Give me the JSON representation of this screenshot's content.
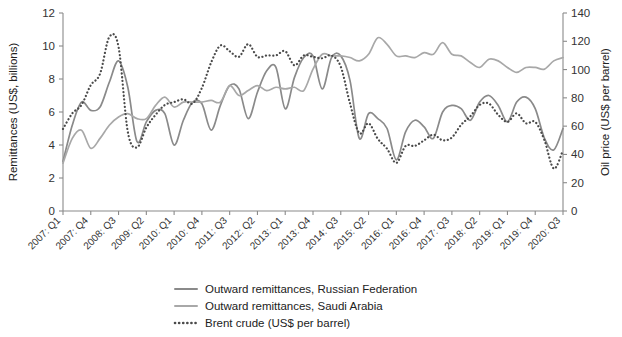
{
  "chart_data": {
    "type": "line",
    "title": "",
    "xlabel": "",
    "ylabel": "Remittances (US$, billions)",
    "y2label": "Oil price (US$ per barrel)",
    "ylim": [
      0,
      12
    ],
    "y2lim": [
      0,
      140
    ],
    "yticks": [
      0,
      2,
      4,
      6,
      8,
      10,
      12
    ],
    "y2ticks": [
      0,
      20,
      40,
      60,
      80,
      100,
      120,
      140
    ],
    "grid": false,
    "legend_position": "bottom-center",
    "x_tick_labels": [
      "2007: Q1",
      "2007: Q4",
      "2008: Q3",
      "2009: Q2",
      "2010: Q1",
      "2010: Q4",
      "2011: Q3",
      "2012: Q2",
      "2013: Q1",
      "2013: Q4",
      "2014: Q3",
      "2015: Q2",
      "2016: Q1",
      "2016: Q4",
      "2017: Q3",
      "2018: Q2",
      "2019: Q1",
      "2019: Q4",
      "2020: Q3"
    ],
    "x": [
      "2007:Q1",
      "2007:Q2",
      "2007:Q3",
      "2007:Q4",
      "2008:Q1",
      "2008:Q2",
      "2008:Q3",
      "2008:Q4",
      "2009:Q1",
      "2009:Q2",
      "2009:Q3",
      "2009:Q4",
      "2010:Q1",
      "2010:Q2",
      "2010:Q3",
      "2010:Q4",
      "2011:Q1",
      "2011:Q2",
      "2011:Q3",
      "2011:Q4",
      "2012:Q1",
      "2012:Q2",
      "2012:Q3",
      "2012:Q4",
      "2013:Q1",
      "2013:Q2",
      "2013:Q3",
      "2013:Q4",
      "2014:Q1",
      "2014:Q2",
      "2014:Q3",
      "2014:Q4",
      "2015:Q1",
      "2015:Q2",
      "2015:Q3",
      "2015:Q4",
      "2016:Q1",
      "2016:Q2",
      "2016:Q3",
      "2016:Q4",
      "2017:Q1",
      "2017:Q2",
      "2017:Q3",
      "2017:Q4",
      "2018:Q1",
      "2018:Q2",
      "2018:Q3",
      "2018:Q4",
      "2019:Q1",
      "2019:Q2",
      "2019:Q3",
      "2019:Q4",
      "2020:Q1",
      "2020:Q2",
      "2020:Q3"
    ],
    "series": [
      {
        "name": "Outward remittances, Russian Federation",
        "axis": "left",
        "unit": "US$ billions",
        "color": "#8a8a8a",
        "style": "solid",
        "values": [
          3.0,
          5.2,
          6.6,
          6.1,
          6.3,
          7.8,
          9.1,
          7.5,
          4.2,
          5.4,
          6.1,
          5.9,
          4.0,
          5.5,
          6.6,
          6.5,
          4.9,
          6.4,
          7.6,
          7.4,
          5.6,
          7.2,
          8.5,
          8.7,
          6.2,
          8.1,
          9.3,
          9.4,
          7.4,
          9.3,
          9.4,
          7.9,
          4.4,
          5.9,
          5.6,
          5.0,
          3.1,
          4.8,
          5.5,
          5.1,
          4.4,
          6.0,
          6.4,
          6.2,
          5.5,
          6.6,
          7.0,
          6.4,
          5.4,
          6.6,
          6.9,
          6.2,
          4.4,
          3.7,
          5.0
        ]
      },
      {
        "name": "Outward remittances, Saudi Arabia",
        "axis": "left",
        "unit": "US$ billions",
        "color": "#a8a8a8",
        "style": "solid",
        "values": [
          2.9,
          4.4,
          4.9,
          3.8,
          4.4,
          5.2,
          5.7,
          5.9,
          5.6,
          5.6,
          6.4,
          6.9,
          6.3,
          6.6,
          6.6,
          6.6,
          6.7,
          6.6,
          7.6,
          7.0,
          7.3,
          7.6,
          7.3,
          7.5,
          7.4,
          7.5,
          7.3,
          8.6,
          9.5,
          9.4,
          9.4,
          9.3,
          9.1,
          9.5,
          10.5,
          10.1,
          9.4,
          9.4,
          9.3,
          9.6,
          9.5,
          10.2,
          9.5,
          9.4,
          9.0,
          8.7,
          9.2,
          9.1,
          8.7,
          8.4,
          8.7,
          8.7,
          8.6,
          9.1,
          9.3
        ]
      },
      {
        "name": "Brent crude (US$ per barrel)",
        "axis": "right",
        "unit": "US$ per barrel",
        "color": "#4a4a4a",
        "style": "dotted",
        "values": [
          58,
          69,
          75,
          89,
          97,
          123,
          116,
          56,
          45,
          59,
          68,
          75,
          77,
          79,
          76,
          87,
          105,
          117,
          113,
          109,
          118,
          109,
          110,
          110,
          113,
          103,
          110,
          109,
          108,
          110,
          102,
          76,
          55,
          62,
          51,
          44,
          34,
          46,
          46,
          50,
          54,
          50,
          52,
          61,
          67,
          75,
          76,
          68,
          63,
          69,
          62,
          63,
          50,
          30,
          43
        ]
      }
    ]
  },
  "axes": {
    "left_title": "Remittances (US$, billions)",
    "right_title": "Oil price (US$ per barrel)"
  },
  "legend": {
    "items": [
      {
        "label": "Outward remittances, Russian Federation",
        "style": "solid",
        "color": "#8a8a8a"
      },
      {
        "label": "Outward remittances, Saudi Arabia",
        "style": "solid",
        "color": "#a8a8a8"
      },
      {
        "label": "Brent crude (US$ per barrel)",
        "style": "dotted",
        "color": "#4a4a4a"
      }
    ]
  }
}
